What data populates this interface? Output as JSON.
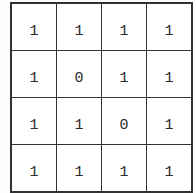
{
  "figure": {
    "name": "binary-matrix",
    "rows": 4,
    "cols": 4,
    "colors": {
      "line": "#333333",
      "cell_background": "#ffffff",
      "page_background": "#fefefe",
      "digit": "#2b2b2b"
    }
  },
  "chart_data": {
    "type": "table",
    "title": "",
    "xlabel": "",
    "ylabel": "",
    "grid": true,
    "categories": [
      "c1",
      "c2",
      "c3",
      "c4"
    ],
    "row_labels": [
      "r1",
      "r2",
      "r3",
      "r4"
    ],
    "values": [
      [
        1,
        1,
        1,
        1
      ],
      [
        1,
        0,
        1,
        1
      ],
      [
        1,
        1,
        0,
        1
      ],
      [
        1,
        1,
        1,
        1
      ]
    ],
    "cells": [
      [
        {
          "text": "1"
        },
        {
          "text": "1"
        },
        {
          "text": "1"
        },
        {
          "text": "1"
        }
      ],
      [
        {
          "text": "1"
        },
        {
          "text": "0"
        },
        {
          "text": "1"
        },
        {
          "text": "1"
        }
      ],
      [
        {
          "text": "1"
        },
        {
          "text": "1"
        },
        {
          "text": "0"
        },
        {
          "text": "1"
        }
      ],
      [
        {
          "text": "1"
        },
        {
          "text": "1"
        },
        {
          "text": "1"
        },
        {
          "text": "1"
        }
      ]
    ]
  }
}
